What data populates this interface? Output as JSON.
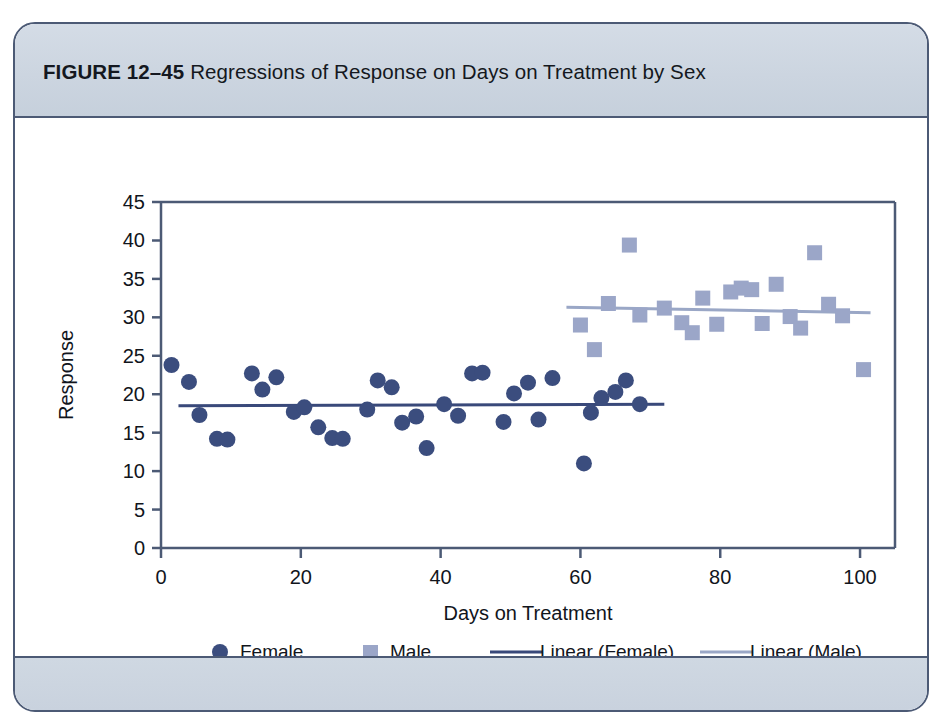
{
  "figure": {
    "label": "FIGURE 12–45",
    "title": "Regressions of Response on Days on Treatment by Sex",
    "frame_border_color": "#4c5a75",
    "band_color": "#ccd5e0",
    "background_color": "#ffffff"
  },
  "chart_data": {
    "type": "scatter",
    "title": "Regressions of Response on Days on Treatment by Sex",
    "xlabel": "Days on Treatment",
    "ylabel": "Response",
    "xlim": [
      0,
      105
    ],
    "ylim": [
      0,
      45
    ],
    "xticks": [
      0,
      20,
      40,
      60,
      80,
      100
    ],
    "yticks": [
      0,
      5,
      10,
      15,
      20,
      25,
      30,
      35,
      40,
      45
    ],
    "grid": false,
    "legend_position": "bottom",
    "axis_color": "#4c5a75",
    "series": [
      {
        "name": "Female",
        "marker": "circle",
        "color": "#3b4d7e",
        "points": [
          [
            1.5,
            23.8
          ],
          [
            4.0,
            21.6
          ],
          [
            5.5,
            17.3
          ],
          [
            8.0,
            14.2
          ],
          [
            9.5,
            14.1
          ],
          [
            13.0,
            22.7
          ],
          [
            14.5,
            20.6
          ],
          [
            16.5,
            22.2
          ],
          [
            19.0,
            17.7
          ],
          [
            20.5,
            18.3
          ],
          [
            22.5,
            15.7
          ],
          [
            24.5,
            14.3
          ],
          [
            26.0,
            14.2
          ],
          [
            29.5,
            18.0
          ],
          [
            31.0,
            21.8
          ],
          [
            33.0,
            20.9
          ],
          [
            34.5,
            16.3
          ],
          [
            36.5,
            17.1
          ],
          [
            38.0,
            13.0
          ],
          [
            40.5,
            18.7
          ],
          [
            42.5,
            17.2
          ],
          [
            44.5,
            22.7
          ],
          [
            46.0,
            22.8
          ],
          [
            49.0,
            16.4
          ],
          [
            50.5,
            20.1
          ],
          [
            52.5,
            21.5
          ],
          [
            54.0,
            16.7
          ],
          [
            56.0,
            22.1
          ],
          [
            60.5,
            11.0
          ],
          [
            61.5,
            17.6
          ],
          [
            63.0,
            19.5
          ],
          [
            65.0,
            20.3
          ],
          [
            66.5,
            21.8
          ],
          [
            68.5,
            18.7
          ]
        ],
        "trend": {
          "name": "Linear (Female)",
          "color": "#39497a",
          "x_start": 2.5,
          "x_end": 72.0,
          "y_start": 18.5,
          "y_end": 18.7
        }
      },
      {
        "name": "Male",
        "marker": "square",
        "color": "#9ba6c8",
        "points": [
          [
            60.0,
            29.0
          ],
          [
            62.0,
            25.8
          ],
          [
            64.0,
            31.8
          ],
          [
            67.0,
            39.4
          ],
          [
            68.5,
            30.3
          ],
          [
            72.0,
            31.2
          ],
          [
            74.5,
            29.3
          ],
          [
            76.0,
            28.0
          ],
          [
            77.5,
            32.5
          ],
          [
            79.5,
            29.1
          ],
          [
            81.5,
            33.3
          ],
          [
            83.0,
            33.8
          ],
          [
            84.5,
            33.6
          ],
          [
            86.0,
            29.2
          ],
          [
            88.0,
            34.3
          ],
          [
            90.0,
            30.1
          ],
          [
            91.5,
            28.6
          ],
          [
            93.5,
            38.4
          ],
          [
            95.5,
            31.7
          ],
          [
            97.5,
            30.2
          ],
          [
            100.5,
            23.2
          ]
        ],
        "trend": {
          "name": "Linear (Male)",
          "color": "#9aa7c6",
          "x_start": 58.0,
          "x_end": 101.5,
          "y_start": 31.3,
          "y_end": 30.6
        }
      }
    ]
  },
  "legend": {
    "items": [
      {
        "label": "Female",
        "marker": "circle",
        "color": "#3b4d7e"
      },
      {
        "label": "Male",
        "marker": "square",
        "color": "#9ba6c8"
      },
      {
        "label": "Linear (Female)",
        "marker": "line",
        "color": "#39497a"
      },
      {
        "label": "Linear (Male)",
        "marker": "line",
        "color": "#9aa7c6"
      }
    ]
  }
}
